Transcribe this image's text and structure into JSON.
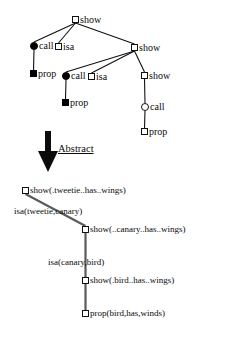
{
  "figure": {
    "transform_label": "Abstract",
    "ink_color": "#111111",
    "abstract_edge_color": "#5a5a5a"
  },
  "concrete_tree": {
    "nodes": [
      {
        "id": "n1",
        "label": "show",
        "shape": "square-open",
        "x": 72,
        "y": 16
      },
      {
        "id": "n2",
        "label": "call",
        "shape": "circle-filled",
        "x": 30,
        "y": 42
      },
      {
        "id": "n3",
        "label": "isa",
        "shape": "square-open",
        "x": 55,
        "y": 43
      },
      {
        "id": "n4",
        "label": "show",
        "shape": "square-open",
        "x": 131,
        "y": 44
      },
      {
        "id": "n5",
        "label": "prop",
        "shape": "square-filled",
        "x": 30,
        "y": 70
      },
      {
        "id": "n6",
        "label": "call",
        "shape": "circle-filled",
        "x": 62,
        "y": 72
      },
      {
        "id": "n7",
        "label": "isa",
        "shape": "square-open",
        "x": 88,
        "y": 73
      },
      {
        "id": "n8",
        "label": "show",
        "shape": "square-open",
        "x": 141,
        "y": 72
      },
      {
        "id": "n9",
        "label": "prop",
        "shape": "square-filled",
        "x": 62,
        "y": 99
      },
      {
        "id": "n10",
        "label": "call",
        "shape": "circle-open",
        "x": 141,
        "y": 103
      },
      {
        "id": "n11",
        "label": "prop",
        "shape": "square-open",
        "x": 141,
        "y": 128
      }
    ],
    "edges": [
      [
        "n1",
        "n2"
      ],
      [
        "n1",
        "n3"
      ],
      [
        "n1",
        "n4"
      ],
      [
        "n2",
        "n5"
      ],
      [
        "n4",
        "n6"
      ],
      [
        "n4",
        "n7"
      ],
      [
        "n4",
        "n8"
      ],
      [
        "n6",
        "n9"
      ],
      [
        "n8",
        "n10"
      ],
      [
        "n10",
        "n11"
      ]
    ]
  },
  "abstract_tree": {
    "nodes": [
      {
        "id": "a1",
        "label": "show(.tweetie..has..wings)",
        "shape": "square-open",
        "x": 22,
        "y": 187
      },
      {
        "id": "a2",
        "label": "show(..canary..has..wings)",
        "shape": "square-open",
        "x": 82,
        "y": 226
      },
      {
        "id": "a3",
        "label": "show(.bird..has..wings)",
        "shape": "square-open",
        "x": 82,
        "y": 277
      },
      {
        "id": "a4",
        "label": "prop(bird,has,winds)",
        "shape": "square-open",
        "x": 82,
        "y": 310
      }
    ],
    "edges": [
      [
        "a1",
        "a2"
      ],
      [
        "a2",
        "a3"
      ],
      [
        "a3",
        "a4"
      ]
    ],
    "edge_labels": [
      {
        "text": "isa(tweetie,canary)",
        "x": 14,
        "y": 207
      },
      {
        "text": "isa(canary,bird)",
        "x": 48,
        "y": 258
      }
    ]
  }
}
